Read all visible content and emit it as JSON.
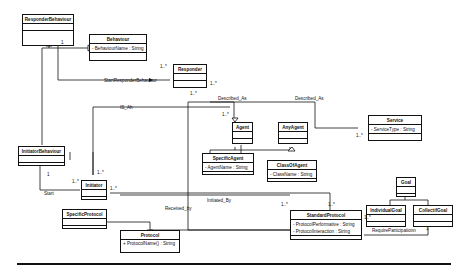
{
  "classes": {
    "responder_behaviour": {
      "name": "ResponderBehaviour",
      "attrs": "",
      "ops": ""
    },
    "behaviour": {
      "name": "Behaviour",
      "attrs": "- BehaviourName : String",
      "ops": ""
    },
    "responder": {
      "name": "Responder",
      "attrs": "",
      "ops": ""
    },
    "agent": {
      "name": "Agent",
      "attrs": "",
      "ops": ""
    },
    "any_agent": {
      "name": "AnyAgent",
      "attrs": "",
      "ops": ""
    },
    "specific_agent": {
      "name": "SpecificAgent",
      "attrs": "- AgentName : String",
      "ops": ""
    },
    "class_of_agent": {
      "name": "ClassOfAgent",
      "attrs": "- ClassName : String",
      "ops": ""
    },
    "service": {
      "name": "Service",
      "attrs": "- ServiceType : String",
      "ops": ""
    },
    "initiator_behaviour": {
      "name": "InitiatorBehaviour",
      "attrs": "",
      "ops": ""
    },
    "initiator": {
      "name": "Initiator",
      "attrs": "",
      "ops": ""
    },
    "specific_protocol": {
      "name": "SpecificProtocol",
      "attrs": "",
      "ops": ""
    },
    "protocol": {
      "name": "Protocol",
      "attrs": "",
      "ops": "+ ProtocolName() : String"
    },
    "standard_protocol": {
      "name": "StandardProtocol",
      "attrs1": "- ProtocolPerformative : String",
      "attrs2": "- ProtocolInteraction : String"
    },
    "goal": {
      "name": "Goal"
    },
    "individual_goal": {
      "name": "IndividualGoal"
    },
    "collectif_goal": {
      "name": "CollectifGoal"
    }
  },
  "associations": {
    "start_responder_behaviour": "StartResponderBehaviour",
    "described_as_1": "Described_As",
    "described_as_2": "Described_As",
    "is_ah": "IS_Ah",
    "start": "Start",
    "initiated_by": "Initiated_By",
    "received_by": "Received_by",
    "require_participation": "RequireParticipationn"
  },
  "multiplicities": {
    "rb_1": "1",
    "responder_top": "1..*",
    "responder_right": "1..*",
    "agent_top": "1..*",
    "agent_left": "1..*",
    "service_left": "1..*",
    "ib_1": "1",
    "initiator_left": "1..*",
    "initiator_top": "1..*",
    "initiator_right": "1..*",
    "sp_top_left": "1..*",
    "sp_top_right": "1..*",
    "sp_right": "1..*",
    "cg_1": "1"
  }
}
